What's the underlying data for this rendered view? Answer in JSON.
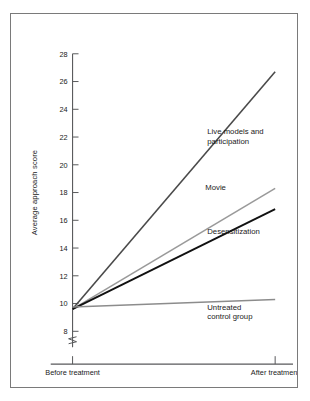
{
  "figure": {
    "background_color": "#ffffff",
    "frame_color": "#7a7a7a",
    "axis_color": "#58595b"
  },
  "chart_data": {
    "type": "line",
    "title": "",
    "xlabel": "",
    "ylabel": "Average approach score",
    "categories": [
      "Before treatment",
      "After treatment"
    ],
    "x": [
      0,
      1
    ],
    "ylim": [
      8,
      28
    ],
    "yticks": [
      8,
      10,
      12,
      14,
      16,
      18,
      20,
      22,
      24,
      26,
      28
    ],
    "ytick_labels": [
      "8",
      "10",
      "12",
      "14",
      "16",
      "18",
      "20",
      "22",
      "24",
      "26",
      "28"
    ],
    "axis_break": true,
    "axis_break_below": 8,
    "grid": false,
    "legend": "inline-labels",
    "series": [
      {
        "name": "Live models and participation",
        "label_lines": [
          "Live models and",
          "participation"
        ],
        "values": [
          9.6,
          26.7
        ],
        "color": "#4a4a4a",
        "width": 1.6,
        "label_x": 0.665,
        "label_y": 22.2
      },
      {
        "name": "Movie",
        "label_lines": [
          "Movie"
        ],
        "values": [
          9.6,
          18.3
        ],
        "color": "#9a9a9a",
        "width": 1.6,
        "label_x": 0.655,
        "label_y": 18.2
      },
      {
        "name": "Desensitization",
        "label_lines": [
          "Desensitization"
        ],
        "values": [
          9.6,
          16.8
        ],
        "color": "#111111",
        "width": 1.9,
        "label_x": 0.665,
        "label_y": 15.0
      },
      {
        "name": "Untreated control group",
        "label_lines": [
          "Untreated",
          "control group"
        ],
        "values": [
          9.75,
          10.3
        ],
        "color": "#8c8c8c",
        "width": 1.5,
        "label_x": 0.665,
        "label_y": 9.55
      }
    ]
  }
}
